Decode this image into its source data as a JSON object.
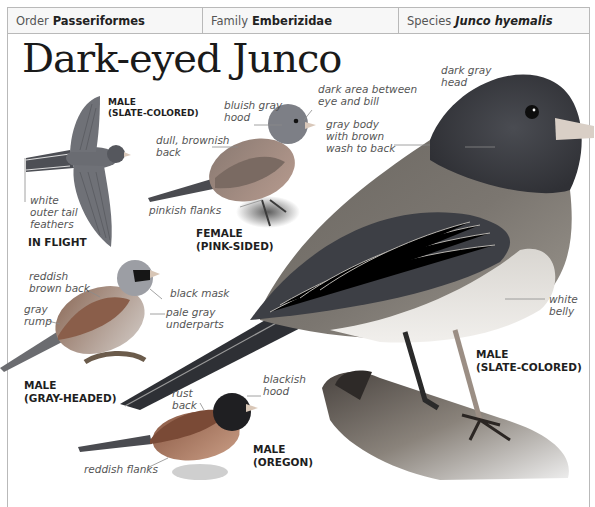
{
  "taxonomy": [
    {
      "key": "Order",
      "value": "Passeriformes",
      "italic": false
    },
    {
      "key": "Family",
      "value": "Emberizidae",
      "italic": false
    },
    {
      "key": "Species",
      "value": "Junco hyemalis",
      "italic": true
    }
  ],
  "title": "Dark-eyed Junco",
  "figures": {
    "in_flight": {
      "caption_sex": "MALE",
      "caption_form": "(SLATE-COLORED)",
      "caption_view": "IN FLIGHT",
      "labels": [
        "white",
        "outer tail",
        "feathers"
      ]
    },
    "female_pink_sided": {
      "caption_sex": "FEMALE",
      "caption_form": "(PINK-SIDED)",
      "labels": {
        "hood": [
          "bluish gray",
          "hood"
        ],
        "back": [
          "dull, brownish",
          "back"
        ],
        "flanks": "pinkish flanks",
        "lores": [
          "dark area between",
          "eye and bill"
        ]
      }
    },
    "male_slate_colored": {
      "caption_sex": "MALE",
      "caption_form": "(SLATE-COLORED)",
      "labels": {
        "head": [
          "dark gray",
          "head"
        ],
        "body": [
          "gray body",
          "with brown",
          "wash to back"
        ],
        "belly": [
          "white",
          "belly"
        ]
      }
    },
    "male_gray_headed": {
      "caption_sex": "MALE",
      "caption_form": "(GRAY-HEADED)",
      "labels": {
        "back": [
          "reddish",
          "brown back"
        ],
        "rump": [
          "gray",
          "rump"
        ],
        "mask": "black mask",
        "underparts": [
          "pale gray",
          "underparts"
        ]
      }
    },
    "male_oregon": {
      "caption_sex": "MALE",
      "caption_form": "(OREGON)",
      "labels": {
        "back": [
          "rust",
          "back"
        ],
        "hood": [
          "blackish",
          "hood"
        ],
        "flanks": "reddish flanks"
      }
    }
  },
  "colors": {
    "border": "#b9b9b9",
    "header_bg": "#f7f7f7",
    "slate": "#5c5f66",
    "slate_dark": "#3b3d42",
    "pale_belly": "#e9e6e2",
    "brown_back": "#8a6d5c",
    "rust": "#8b5a45",
    "pinkish": "#c3a192",
    "leader": "#8c8c8c"
  }
}
